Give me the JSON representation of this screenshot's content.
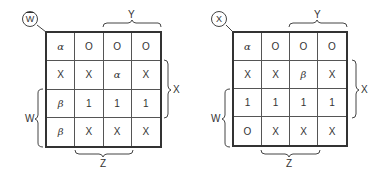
{
  "maps": [
    {
      "variable": "W",
      "variable_bar": true,
      "cells": [
        [
          "α",
          "O",
          "O",
          "O"
        ],
        [
          "X",
          "X",
          "α",
          "X"
        ],
        [
          "β",
          "1",
          "1",
          "1"
        ],
        [
          "β",
          "X",
          "X",
          "X"
        ]
      ],
      "labels": {
        "top": "Y",
        "right": "X",
        "left": "W",
        "bottom": "Z"
      }
    },
    {
      "variable": "X",
      "variable_bar": false,
      "cells": [
        [
          "α",
          "O",
          "O",
          "O"
        ],
        [
          "X",
          "X",
          "β",
          "X"
        ],
        [
          "1",
          "1",
          "1",
          "1"
        ],
        [
          "O",
          "X",
          "X",
          "X"
        ]
      ],
      "labels": {
        "top": "Y",
        "right": "X",
        "left": "W",
        "bottom": "Z"
      }
    }
  ]
}
